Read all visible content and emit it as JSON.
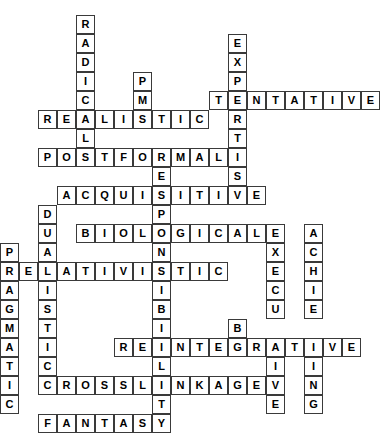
{
  "puzzle": {
    "title": "Crossword Grid",
    "cell_size": 19,
    "origin_x": 0,
    "origin_y": 15,
    "columns": 20,
    "rows": 22,
    "grid_color": "#3a3a3a",
    "background_color": "#ffffff",
    "letter_color": "#000000",
    "entries": [
      {
        "answer": "RADICAL",
        "direction": "down",
        "row": 0,
        "col": 4,
        "length": 7
      },
      {
        "answer": "PM",
        "direction": "down",
        "row": 3,
        "col": 7,
        "length": 2
      },
      {
        "answer": "REALISTIC",
        "direction": "across",
        "row": 5,
        "col": 2,
        "length": 9
      },
      {
        "answer": "EXPERTISE",
        "direction": "down",
        "row": 1,
        "col": 12,
        "length": 9
      },
      {
        "answer": "TENTATIVE",
        "direction": "across",
        "row": 4,
        "col": 11,
        "length": 9
      },
      {
        "answer": "POSTFORMAL",
        "direction": "across",
        "row": 7,
        "col": 2,
        "length": 10
      },
      {
        "answer": "RESPONSIBILITY",
        "direction": "down",
        "row": 7,
        "col": 8,
        "length": 14
      },
      {
        "answer": "ACQUISITIVE",
        "direction": "across",
        "row": 9,
        "col": 3,
        "length": 11
      },
      {
        "answer": "DUALISTIC",
        "direction": "down",
        "row": 10,
        "col": 2,
        "length": 9
      },
      {
        "answer": "BIOLOGICAL",
        "direction": "across",
        "row": 11,
        "col": 4,
        "length": 10
      },
      {
        "answer": "EXECUTIVE",
        "direction": "down",
        "row": 11,
        "col": 14,
        "length": 9
      },
      {
        "answer": "ACHIEVING",
        "direction": "down",
        "row": 11,
        "col": 16,
        "length": 9
      },
      {
        "answer": "PRAGMATIC",
        "direction": "down",
        "row": 12,
        "col": 0,
        "length": 9
      },
      {
        "answer": "RELATIVISTIC",
        "direction": "across",
        "row": 13,
        "col": 0,
        "length": 12
      },
      {
        "answer": "BM",
        "direction": "down",
        "row": 16,
        "col": 12,
        "length": 2
      },
      {
        "answer": "REINTEGRATIVE",
        "direction": "across",
        "row": 17,
        "col": 6,
        "length": 13
      },
      {
        "answer": "CROSSLINKAGE",
        "direction": "across",
        "row": 19,
        "col": 2,
        "length": 12
      },
      {
        "answer": "FANTASY",
        "direction": "across",
        "row": 21,
        "col": 2,
        "length": 7
      }
    ],
    "cells": [
      {
        "r": 0,
        "c": 4,
        "l": "R"
      },
      {
        "r": 1,
        "c": 4,
        "l": "A"
      },
      {
        "r": 1,
        "c": 12,
        "l": "E"
      },
      {
        "r": 2,
        "c": 4,
        "l": "D"
      },
      {
        "r": 2,
        "c": 12,
        "l": "X"
      },
      {
        "r": 3,
        "c": 4,
        "l": "I"
      },
      {
        "r": 3,
        "c": 7,
        "l": "P"
      },
      {
        "r": 3,
        "c": 12,
        "l": "P"
      },
      {
        "r": 4,
        "c": 4,
        "l": "C"
      },
      {
        "r": 4,
        "c": 7,
        "l": "M"
      },
      {
        "r": 4,
        "c": 11,
        "l": "T"
      },
      {
        "r": 4,
        "c": 12,
        "l": "E"
      },
      {
        "r": 4,
        "c": 13,
        "l": "N"
      },
      {
        "r": 4,
        "c": 14,
        "l": "T"
      },
      {
        "r": 4,
        "c": 15,
        "l": "A"
      },
      {
        "r": 4,
        "c": 16,
        "l": "T"
      },
      {
        "r": 4,
        "c": 17,
        "l": "I"
      },
      {
        "r": 4,
        "c": 18,
        "l": "V"
      },
      {
        "r": 4,
        "c": 19,
        "l": "E"
      },
      {
        "r": 5,
        "c": 2,
        "l": "R"
      },
      {
        "r": 5,
        "c": 3,
        "l": "E"
      },
      {
        "r": 5,
        "c": 4,
        "l": "A"
      },
      {
        "r": 5,
        "c": 5,
        "l": "L"
      },
      {
        "r": 5,
        "c": 6,
        "l": "I"
      },
      {
        "r": 5,
        "c": 7,
        "l": "S"
      },
      {
        "r": 5,
        "c": 8,
        "l": "T"
      },
      {
        "r": 5,
        "c": 9,
        "l": "I"
      },
      {
        "r": 5,
        "c": 10,
        "l": "C"
      },
      {
        "r": 5,
        "c": 12,
        "l": "R"
      },
      {
        "r": 6,
        "c": 4,
        "l": "L"
      },
      {
        "r": 6,
        "c": 12,
        "l": "T"
      },
      {
        "r": 7,
        "c": 2,
        "l": "P"
      },
      {
        "r": 7,
        "c": 3,
        "l": "O"
      },
      {
        "r": 7,
        "c": 4,
        "l": "S"
      },
      {
        "r": 7,
        "c": 5,
        "l": "T"
      },
      {
        "r": 7,
        "c": 6,
        "l": "F"
      },
      {
        "r": 7,
        "c": 7,
        "l": "O"
      },
      {
        "r": 7,
        "c": 8,
        "l": "R"
      },
      {
        "r": 7,
        "c": 9,
        "l": "M"
      },
      {
        "r": 7,
        "c": 10,
        "l": "A"
      },
      {
        "r": 7,
        "c": 11,
        "l": "L"
      },
      {
        "r": 7,
        "c": 12,
        "l": "I"
      },
      {
        "r": 8,
        "c": 8,
        "l": "E"
      },
      {
        "r": 8,
        "c": 12,
        "l": "S"
      },
      {
        "r": 9,
        "c": 3,
        "l": "A"
      },
      {
        "r": 9,
        "c": 4,
        "l": "C"
      },
      {
        "r": 9,
        "c": 5,
        "l": "Q"
      },
      {
        "r": 9,
        "c": 6,
        "l": "U"
      },
      {
        "r": 9,
        "c": 7,
        "l": "I"
      },
      {
        "r": 9,
        "c": 8,
        "l": "S"
      },
      {
        "r": 9,
        "c": 9,
        "l": "I"
      },
      {
        "r": 9,
        "c": 10,
        "l": "T"
      },
      {
        "r": 9,
        "c": 11,
        "l": "I"
      },
      {
        "r": 9,
        "c": 12,
        "l": "V"
      },
      {
        "r": 9,
        "c": 13,
        "l": "E"
      },
      {
        "r": 10,
        "c": 2,
        "l": "D"
      },
      {
        "r": 10,
        "c": 8,
        "l": "P"
      },
      {
        "r": 11,
        "c": 2,
        "l": "U"
      },
      {
        "r": 11,
        "c": 4,
        "l": "B"
      },
      {
        "r": 11,
        "c": 5,
        "l": "I"
      },
      {
        "r": 11,
        "c": 6,
        "l": "O"
      },
      {
        "r": 11,
        "c": 7,
        "l": "L"
      },
      {
        "r": 11,
        "c": 8,
        "l": "O"
      },
      {
        "r": 11,
        "c": 9,
        "l": "G"
      },
      {
        "r": 11,
        "c": 10,
        "l": "I"
      },
      {
        "r": 11,
        "c": 11,
        "l": "C"
      },
      {
        "r": 11,
        "c": 12,
        "l": "A"
      },
      {
        "r": 11,
        "c": 13,
        "l": "L"
      },
      {
        "r": 11,
        "c": 14,
        "l": "E"
      },
      {
        "r": 11,
        "c": 16,
        "l": "A"
      },
      {
        "r": 12,
        "c": 0,
        "l": "P"
      },
      {
        "r": 12,
        "c": 2,
        "l": "A"
      },
      {
        "r": 12,
        "c": 8,
        "l": "N"
      },
      {
        "r": 12,
        "c": 14,
        "l": "X"
      },
      {
        "r": 12,
        "c": 16,
        "l": "C"
      },
      {
        "r": 13,
        "c": 0,
        "l": "R"
      },
      {
        "r": 13,
        "c": 1,
        "l": "E"
      },
      {
        "r": 13,
        "c": 2,
        "l": "L"
      },
      {
        "r": 13,
        "c": 3,
        "l": "A"
      },
      {
        "r": 13,
        "c": 4,
        "l": "T"
      },
      {
        "r": 13,
        "c": 5,
        "l": "I"
      },
      {
        "r": 13,
        "c": 6,
        "l": "V"
      },
      {
        "r": 13,
        "c": 7,
        "l": "I"
      },
      {
        "r": 13,
        "c": 8,
        "l": "S"
      },
      {
        "r": 13,
        "c": 9,
        "l": "T"
      },
      {
        "r": 13,
        "c": 10,
        "l": "I"
      },
      {
        "r": 13,
        "c": 11,
        "l": "C"
      },
      {
        "r": 13,
        "c": 14,
        "l": "E"
      },
      {
        "r": 13,
        "c": 16,
        "l": "H"
      },
      {
        "r": 14,
        "c": 0,
        "l": "A"
      },
      {
        "r": 14,
        "c": 2,
        "l": "I"
      },
      {
        "r": 14,
        "c": 8,
        "l": "I"
      },
      {
        "r": 14,
        "c": 14,
        "l": "C"
      },
      {
        "r": 14,
        "c": 16,
        "l": "I"
      },
      {
        "r": 15,
        "c": 0,
        "l": "G"
      },
      {
        "r": 15,
        "c": 2,
        "l": "S"
      },
      {
        "r": 15,
        "c": 8,
        "l": "B"
      },
      {
        "r": 15,
        "c": 14,
        "l": "U"
      },
      {
        "r": 15,
        "c": 16,
        "l": "E"
      },
      {
        "r": 16,
        "c": 0,
        "l": "M"
      },
      {
        "r": 16,
        "c": 2,
        "l": "T"
      },
      {
        "r": 16,
        "c": 8,
        "l": "I"
      },
      {
        "r": 16,
        "c": 12,
        "l": "B"
      },
      {
        "r": 17,
        "c": 0,
        "l": "A"
      },
      {
        "r": 17,
        "c": 2,
        "l": "I"
      },
      {
        "r": 17,
        "c": 6,
        "l": "R"
      },
      {
        "r": 17,
        "c": 7,
        "l": "E"
      },
      {
        "r": 17,
        "c": 8,
        "l": "I"
      },
      {
        "r": 17,
        "c": 9,
        "l": "N"
      },
      {
        "r": 17,
        "c": 10,
        "l": "T"
      },
      {
        "r": 17,
        "c": 11,
        "l": "E"
      },
      {
        "r": 17,
        "c": 12,
        "l": "G"
      },
      {
        "r": 17,
        "c": 13,
        "l": "R"
      },
      {
        "r": 17,
        "c": 14,
        "l": "A"
      },
      {
        "r": 17,
        "c": 15,
        "l": "T"
      },
      {
        "r": 17,
        "c": 16,
        "l": "I"
      },
      {
        "r": 17,
        "c": 17,
        "l": "V"
      },
      {
        "r": 17,
        "c": 18,
        "l": "E"
      },
      {
        "r": 18,
        "c": 0,
        "l": "T"
      },
      {
        "r": 18,
        "c": 2,
        "l": "C"
      },
      {
        "r": 18,
        "c": 8,
        "l": "L"
      },
      {
        "r": 18,
        "c": 14,
        "l": "I"
      },
      {
        "r": 18,
        "c": 16,
        "l": "I"
      },
      {
        "r": 19,
        "c": 0,
        "l": "I"
      },
      {
        "r": 19,
        "c": 2,
        "l": "C"
      },
      {
        "r": 19,
        "c": 3,
        "l": "R"
      },
      {
        "r": 19,
        "c": 4,
        "l": "O"
      },
      {
        "r": 19,
        "c": 5,
        "l": "S"
      },
      {
        "r": 19,
        "c": 6,
        "l": "S"
      },
      {
        "r": 19,
        "c": 7,
        "l": "L"
      },
      {
        "r": 19,
        "c": 8,
        "l": "I"
      },
      {
        "r": 19,
        "c": 9,
        "l": "N"
      },
      {
        "r": 19,
        "c": 10,
        "l": "K"
      },
      {
        "r": 19,
        "c": 11,
        "l": "A"
      },
      {
        "r": 19,
        "c": 12,
        "l": "G"
      },
      {
        "r": 19,
        "c": 13,
        "l": "E"
      },
      {
        "r": 19,
        "c": 14,
        "l": "V"
      },
      {
        "r": 19,
        "c": 16,
        "l": "N"
      },
      {
        "r": 20,
        "c": 0,
        "l": "C"
      },
      {
        "r": 20,
        "c": 8,
        "l": "T"
      },
      {
        "r": 20,
        "c": 14,
        "l": "E"
      },
      {
        "r": 20,
        "c": 16,
        "l": "G"
      },
      {
        "r": 21,
        "c": 2,
        "l": "F"
      },
      {
        "r": 21,
        "c": 3,
        "l": "A"
      },
      {
        "r": 21,
        "c": 4,
        "l": "N"
      },
      {
        "r": 21,
        "c": 5,
        "l": "T"
      },
      {
        "r": 21,
        "c": 6,
        "l": "A"
      },
      {
        "r": 21,
        "c": 7,
        "l": "S"
      },
      {
        "r": 21,
        "c": 8,
        "l": "Y"
      }
    ]
  }
}
